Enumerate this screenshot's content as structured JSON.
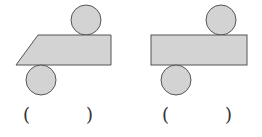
{
  "figures": [
    {
      "id": "net-a",
      "shape": "parallelogram-with-two-circles",
      "answer_left": "(",
      "answer_right": ")",
      "answer": ""
    },
    {
      "id": "net-b",
      "shape": "rectangle-with-two-circles",
      "answer_left": "(",
      "answer_right": ")",
      "answer": ""
    }
  ],
  "colors": {
    "fill": "#d3d3d3",
    "stroke": "#555555",
    "background": "#ffffff"
  }
}
